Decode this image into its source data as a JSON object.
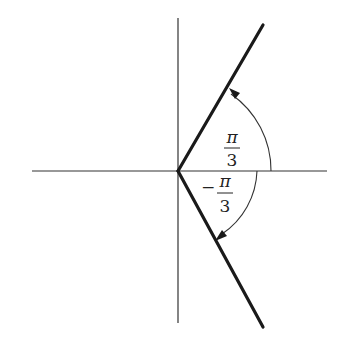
{
  "diagram": {
    "title": "",
    "axes": {
      "origin": [
        178,
        171
      ],
      "horizontal": {
        "x1": 32,
        "x2": 327
      },
      "vertical": {
        "y1": 18,
        "y2": 323
      }
    },
    "rays": [
      {
        "name": "upper-ray",
        "angle": "π/3",
        "end": [
          263,
          25
        ]
      },
      {
        "name": "lower-ray",
        "angle": "-π/3",
        "end": [
          263,
          327
        ]
      }
    ],
    "angles": [
      {
        "name": "positive-angle",
        "label_num": "π",
        "label_den": "3",
        "sign": "",
        "radius": 93,
        "direction": "counterclockwise"
      },
      {
        "name": "negative-angle",
        "label_num": "π",
        "label_den": "3",
        "sign": "−",
        "radius": 79,
        "direction": "clockwise"
      }
    ],
    "colors": {
      "axis": "#333333",
      "ray": "#1a1a1a",
      "arc": "#333333"
    }
  }
}
